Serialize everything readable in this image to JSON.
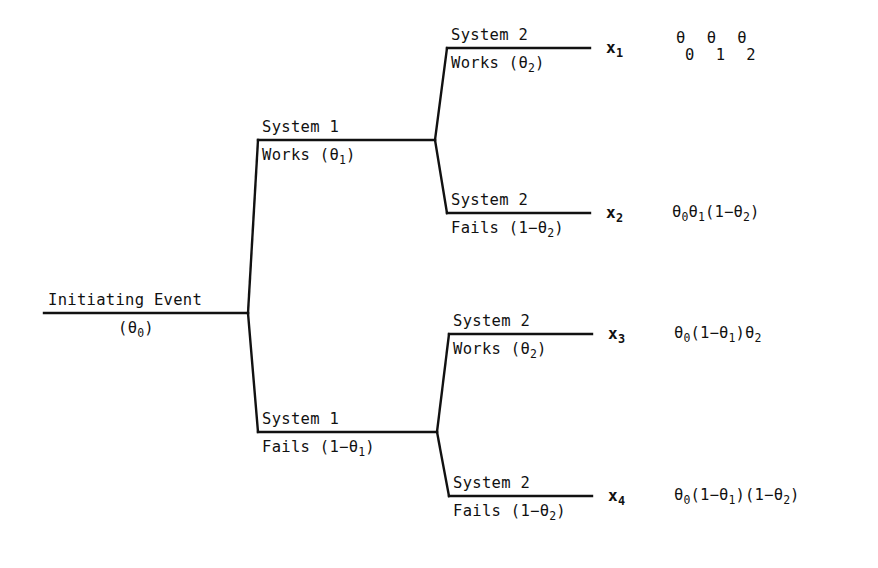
{
  "diagram": {
    "type": "event-tree",
    "background_color": "#ffffff",
    "ink_color": "#111111"
  },
  "root": {
    "label": "Initiating Event",
    "probability": "(θ",
    "probability_sub": "0",
    "probability_close": ")"
  },
  "branches": [
    {
      "id": "system1-works",
      "name": "System 1",
      "outcome_word": "Works",
      "prob_open": "(θ",
      "prob_sub": "1",
      "prob_close": ")"
    },
    {
      "id": "system1-fails",
      "name": "System 1",
      "outcome_word": "Fails",
      "prob_open": "(1−θ",
      "prob_sub": "1",
      "prob_close": ")"
    },
    {
      "id": "system2-works-upper",
      "name": "System 2",
      "outcome_word": "Works",
      "prob_open": "(θ",
      "prob_sub": "2",
      "prob_close": ")"
    },
    {
      "id": "system2-fails-upper",
      "name": "System 2",
      "outcome_word": "Fails",
      "prob_open": "(1−θ",
      "prob_sub": "2",
      "prob_close": ")"
    },
    {
      "id": "system2-works-lower",
      "name": "System 2",
      "outcome_word": "Works",
      "prob_open": "(θ",
      "prob_sub": "2",
      "prob_close": ")"
    },
    {
      "id": "system2-fails-lower",
      "name": "System 2",
      "outcome_word": "Fails",
      "prob_open": "(1−θ",
      "prob_sub": "2",
      "prob_close": ")"
    }
  ],
  "outcomes": [
    {
      "symbol": "x",
      "index": "1",
      "path": [
        "System 1 Works",
        "System 2 Works"
      ],
      "probability_display_style": "stacked",
      "probability_row_top": "θ θ θ",
      "probability_row_bottom": "0 1 2",
      "probability_text": "θ₀θ₁θ₂"
    },
    {
      "symbol": "x",
      "index": "2",
      "path": [
        "System 1 Works",
        "System 2 Fails"
      ],
      "probability_display_style": "inline",
      "probability_parts": [
        {
          "base": "θ",
          "sub": "0"
        },
        {
          "base": "θ",
          "sub": "1"
        },
        {
          "base": "(1−θ",
          "sub": "2"
        },
        {
          "base": ")",
          "sub": ""
        }
      ],
      "probability_text": "θ₀θ₁(1−θ₂)"
    },
    {
      "symbol": "x",
      "index": "3",
      "path": [
        "System 1 Fails",
        "System 2 Works"
      ],
      "probability_display_style": "inline",
      "probability_parts": [
        {
          "base": "θ",
          "sub": "0"
        },
        {
          "base": "(1−θ",
          "sub": "1"
        },
        {
          "base": ")θ",
          "sub": "2"
        }
      ],
      "probability_text": "θ₀(1−θ₁)θ₂"
    },
    {
      "symbol": "x",
      "index": "4",
      "path": [
        "System 1 Fails",
        "System 2 Fails"
      ],
      "probability_display_style": "inline",
      "probability_parts": [
        {
          "base": "θ",
          "sub": "0"
        },
        {
          "base": "(1−θ",
          "sub": "1"
        },
        {
          "base": ")(1−θ",
          "sub": "2"
        },
        {
          "base": ")",
          "sub": ""
        }
      ],
      "probability_text": "θ₀(1−θ₁)(1−θ₂)"
    }
  ]
}
